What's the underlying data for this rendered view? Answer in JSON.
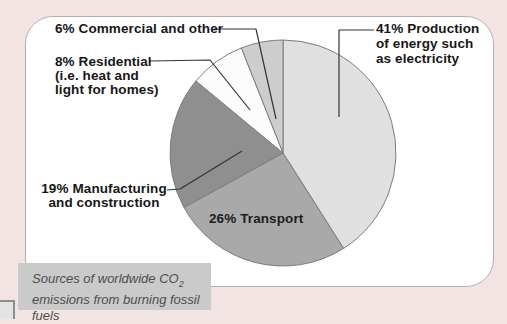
{
  "chart_data": {
    "type": "pie",
    "title": "Sources of worldwide CO2 emissions from burning fossil fuels",
    "direction": "clockwise",
    "start_angle_deg": 0,
    "legend": "none",
    "label_style": "callout",
    "slices": [
      {
        "name": "production",
        "label": "Production of energy such as electricity",
        "value": 41,
        "color": "#e0e0e0"
      },
      {
        "name": "transport",
        "label": "Transport",
        "value": 26,
        "color": "#a9a9a9"
      },
      {
        "name": "manufacturing",
        "label": "Manufacturing and construction",
        "value": 19,
        "color": "#8f8f8f"
      },
      {
        "name": "residential",
        "label": "Residential (i.e. heat and light for homes)",
        "value": 8,
        "color": "#fcfcfc"
      },
      {
        "name": "commercial",
        "label": "Commercial and other",
        "value": 6,
        "color": "#cdcdcd"
      }
    ]
  },
  "labels": {
    "commercial": "6% Commercial and other",
    "residential": "8% Residential\n(i.e. heat and\nlight for homes)",
    "production": "41% Production\nof energy such\nas electricity",
    "manufacturing": "19% Manufacturing\nand construction",
    "transport": "26% Transport"
  },
  "caption": {
    "line1": "Sources of worldwide CO",
    "sub": "2",
    "line2": "emissions from burning fossil fuels"
  },
  "colors": {
    "page_background": "#f2e4e3",
    "card_background": "#ffffff",
    "card_border": "#b2afae",
    "caption_background": "#cacaca",
    "caption_text": "#4d4d4d",
    "label_text": "#171717",
    "slice_outline": "#7d7d7d",
    "leader_line": "#333333"
  }
}
